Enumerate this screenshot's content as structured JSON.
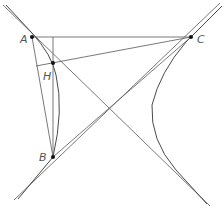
{
  "figure": {
    "colors": {
      "line": "#6a6a6a",
      "curve": "#4a4a4a",
      "point": "#111111",
      "label": "#555555"
    },
    "points": [
      {
        "id": "A",
        "label": "A",
        "x": 32,
        "y": 37,
        "label_x": 20,
        "label_y": 43
      },
      {
        "id": "H",
        "label": "H",
        "x": 53,
        "y": 63,
        "label_x": 43,
        "label_y": 80
      },
      {
        "id": "B",
        "label": "B",
        "x": 53,
        "y": 157,
        "label_x": 39,
        "label_y": 161
      },
      {
        "id": "C",
        "label": "C",
        "x": 191,
        "y": 37,
        "label_x": 197,
        "label_y": 43
      }
    ]
  }
}
